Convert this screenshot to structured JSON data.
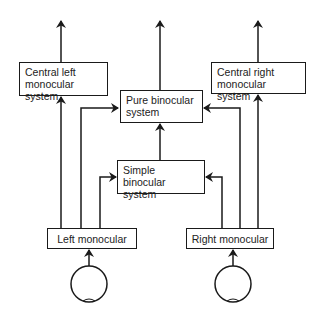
{
  "diagram": {
    "type": "flow",
    "boxes": {
      "central_left": {
        "line1": "Central left",
        "line2": "monocular system"
      },
      "pure_binocular": {
        "line1": "Pure binocular",
        "line2": "system"
      },
      "central_right": {
        "line1": "Central right",
        "line2": "monocular system"
      },
      "simple_binocular": {
        "line1": "Simple binocular",
        "line2": "system"
      },
      "left_monocular": {
        "label": "Left monocular"
      },
      "right_monocular": {
        "label": "Right monocular"
      }
    },
    "eyes": [
      "left-eye",
      "right-eye"
    ],
    "edges": [
      {
        "from": "left-eye",
        "to": "left_monocular"
      },
      {
        "from": "right-eye",
        "to": "right_monocular"
      },
      {
        "from": "left_monocular",
        "to": "central_left"
      },
      {
        "from": "left_monocular",
        "to": "pure_binocular"
      },
      {
        "from": "left_monocular",
        "to": "simple_binocular"
      },
      {
        "from": "right_monocular",
        "to": "central_right"
      },
      {
        "from": "right_monocular",
        "to": "pure_binocular"
      },
      {
        "from": "right_monocular",
        "to": "simple_binocular"
      },
      {
        "from": "simple_binocular",
        "to": "pure_binocular"
      },
      {
        "from": "central_left",
        "to": "output"
      },
      {
        "from": "pure_binocular",
        "to": "output"
      },
      {
        "from": "central_right",
        "to": "output"
      }
    ],
    "colors": {
      "line": "#1a1a1a",
      "background": "#ffffff"
    }
  }
}
